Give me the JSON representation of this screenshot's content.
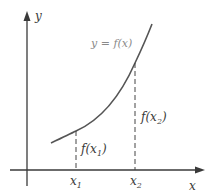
{
  "diagram": {
    "colors": {
      "axis": "#3a3a3a",
      "curve": "#555555",
      "dashed": "#444444",
      "curve_label": "#8a8a8a",
      "text": "#3a3a3a"
    },
    "axes": {
      "x_label": "x",
      "y_label": "y"
    },
    "curve": {
      "label": "y = f(x)"
    },
    "points": [
      {
        "x_label_base": "x",
        "x_label_sub": "1",
        "value_label_pre": "f(x",
        "value_label_sub": "1",
        "value_label_post": ")"
      },
      {
        "x_label_base": "x",
        "x_label_sub": "2",
        "value_label_pre": "f(x",
        "value_label_sub": "2",
        "value_label_post": ")"
      }
    ]
  }
}
